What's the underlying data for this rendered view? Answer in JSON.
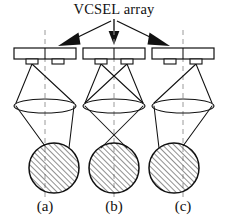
{
  "figure": {
    "title": "VCSEL array",
    "panels": [
      {
        "id": "a",
        "label": "(a)",
        "center_x": 45,
        "active_emitter": "left",
        "spot_offset": 9,
        "description": "left emitter on, beam spot shifted right of optical axis"
      },
      {
        "id": "b",
        "label": "(b)",
        "center_x": 114,
        "active_emitter": "both",
        "spot_offset": 0,
        "description": "both emitters on, rays cross, beam spot centered on optical axis"
      },
      {
        "id": "c",
        "label": "(c)",
        "center_x": 183,
        "active_emitter": "right",
        "spot_offset": -9,
        "description": "right emitter on, beam spot shifted left of optical axis"
      }
    ],
    "annotations": {
      "arrow_targets": [
        "a",
        "b",
        "c"
      ],
      "arrow_source_label": "VCSEL array"
    },
    "geometry": {
      "bar_y": 48,
      "bar_height": 11,
      "bar_half_width": 31,
      "pad_y": 59,
      "pad_height": 5,
      "pad_half_width": 6,
      "pad_dx": 13,
      "lens_y": 106,
      "lens_rx": 31,
      "lens_ry": 7,
      "spot_cy": 168,
      "spot_r": 25,
      "title_y": 14,
      "label_y": 211
    },
    "colors": {
      "ink": "#111111",
      "axis": "#9a9a9a",
      "background": "#ffffff",
      "hatch": "#333333"
    },
    "hatch": {
      "angle_deg": 45,
      "spacing_px": 4,
      "direction": "lower-left to upper-right"
    }
  }
}
